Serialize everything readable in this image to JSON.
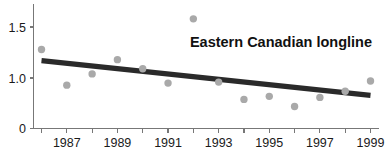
{
  "chart_data": {
    "type": "scatter",
    "title": "Eastern Canadian longline",
    "xlabel": "",
    "ylabel": "",
    "grid": false,
    "legend": null,
    "xlim": [
      1985.6,
      1999.4
    ],
    "ylim": [
      0,
      1.68
    ],
    "y_axis_broken": true,
    "y_tick_labels": [
      "0",
      "1.0",
      "1.5"
    ],
    "y_tick_values": [
      0,
      1.0,
      1.5
    ],
    "x_tick_values": [
      1986,
      1987,
      1988,
      1989,
      1990,
      1991,
      1992,
      1993,
      1994,
      1995,
      1996,
      1997,
      1998,
      1999
    ],
    "x_tick_labels": [
      "",
      "1987",
      "",
      "1989",
      "",
      "1991",
      "",
      "1993",
      "",
      "1995",
      "",
      "1997",
      "",
      "1999"
    ],
    "x": [
      1986,
      1987,
      1988,
      1989,
      1990,
      1991,
      1992,
      1993,
      1994,
      1995,
      1996,
      1997,
      1998,
      1999
    ],
    "values": [
      1.28,
      0.93,
      1.04,
      1.18,
      1.09,
      0.95,
      1.58,
      0.96,
      0.79,
      0.82,
      0.72,
      0.81,
      0.87,
      0.97
    ],
    "series": [
      {
        "name": "Eastern Canadian longline",
        "marker": "circle",
        "color": "#a9a9a9",
        "values": [
          1.28,
          0.93,
          1.04,
          1.18,
          1.09,
          0.95,
          1.58,
          0.96,
          0.79,
          0.82,
          0.72,
          0.81,
          0.87,
          0.97
        ]
      }
    ],
    "trend_line": {
      "name": "linear-trend",
      "color": "#2a2a2a",
      "x_start": 1986,
      "y_start": 1.17,
      "x_end": 1999,
      "y_end": 0.83
    }
  },
  "colors": {
    "marker": "#a9a9a9",
    "trend": "#2a2a2a",
    "axis": "#777777",
    "text": "#1a1a1a",
    "background": "#ffffff"
  }
}
